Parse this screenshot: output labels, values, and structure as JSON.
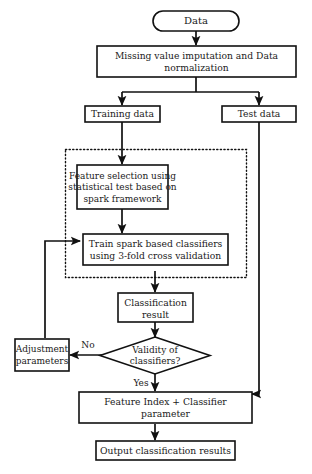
{
  "diagram": {
    "colors": {
      "stroke": "#111111",
      "fill": "#ffffff",
      "text": "#1a1a1a"
    },
    "nodes": {
      "data": {
        "label": "Data",
        "shape": "stadium"
      },
      "preprocess": {
        "label_line1": "Missing value imputation and Data",
        "label_line2": "normalization",
        "shape": "rect"
      },
      "training_data": {
        "label": "Training data",
        "shape": "rect"
      },
      "test_data": {
        "label": "Test data",
        "shape": "rect"
      },
      "feature_selection": {
        "label_line1": "Feature selection using",
        "label_line2": "statistical test based on",
        "label_line3": "spark framework",
        "shape": "rect"
      },
      "train_classifiers": {
        "label_line1": "Train spark based classifiers",
        "label_line2": "using 3-fold cross validation",
        "shape": "rect"
      },
      "classification_result": {
        "label_line1": "Classification",
        "label_line2": "result",
        "shape": "rect"
      },
      "validity": {
        "label_line1": "Validity of",
        "label_line2": "classifiers?",
        "shape": "diamond"
      },
      "adjustment": {
        "label_line1": "Adjustment",
        "label_line2": "parameters",
        "shape": "rect"
      },
      "feature_index": {
        "label_line1": "Feature Index + Classifier",
        "label_line2": "parameter",
        "shape": "rect"
      },
      "output": {
        "label": "Output classification results",
        "shape": "rect"
      }
    },
    "edge_labels": {
      "no": "No",
      "yes": "Yes"
    },
    "group": {
      "name": "spark-framework-group",
      "style": "dotted"
    },
    "caption": ""
  }
}
